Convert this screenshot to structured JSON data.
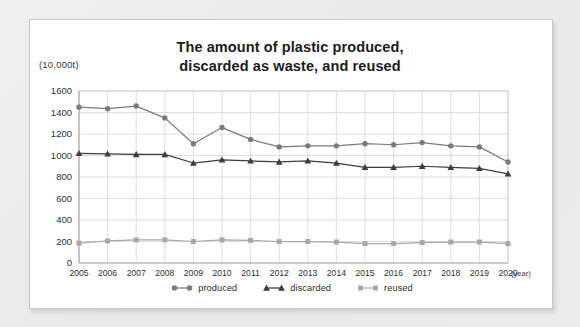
{
  "card": {
    "title_line1": "The amount of plastic produced,",
    "title_line2": "discarded as waste, and reused",
    "unit_label": "(10,000t)",
    "xaxis_unit": "(year)"
  },
  "legend": {
    "items": [
      {
        "label": "produced",
        "marker": "circle-marker",
        "color": "#7a7a7a"
      },
      {
        "label": "discarded",
        "marker": "triangle-marker",
        "color": "#3d3d3d"
      },
      {
        "label": "reused",
        "marker": "square-marker",
        "color": "#a8a8a8"
      }
    ]
  },
  "chart_data": {
    "type": "line",
    "title": "The amount of plastic produced, discarded as waste, and reused",
    "xlabel": "(year)",
    "ylabel": "(10,000t)",
    "ylim": [
      0,
      1600
    ],
    "ytick_step": 200,
    "yticks": [
      0,
      200,
      400,
      600,
      800,
      1000,
      1200,
      1400,
      1600
    ],
    "grid": true,
    "legend_position": "bottom-center",
    "categories": [
      "2005",
      "2006",
      "2007",
      "2008",
      "2009",
      "2010",
      "2011",
      "2012",
      "2013",
      "2014",
      "2015",
      "2016",
      "2017",
      "2018",
      "2019",
      "2020"
    ],
    "series": [
      {
        "name": "produced",
        "marker": "circle",
        "color": "#7a7a7a",
        "values": [
          1450,
          1435,
          1460,
          1350,
          1110,
          1260,
          1150,
          1080,
          1090,
          1090,
          1110,
          1100,
          1120,
          1090,
          1080,
          940
        ]
      },
      {
        "name": "discarded",
        "marker": "triangle",
        "color": "#3d3d3d",
        "values": [
          1020,
          1015,
          1010,
          1010,
          930,
          960,
          950,
          940,
          950,
          930,
          890,
          890,
          900,
          890,
          880,
          830
        ]
      },
      {
        "name": "reused",
        "marker": "square",
        "color": "#a8a8a8",
        "values": [
          185,
          205,
          215,
          215,
          200,
          215,
          210,
          200,
          200,
          195,
          180,
          180,
          190,
          195,
          195,
          180
        ]
      }
    ]
  }
}
